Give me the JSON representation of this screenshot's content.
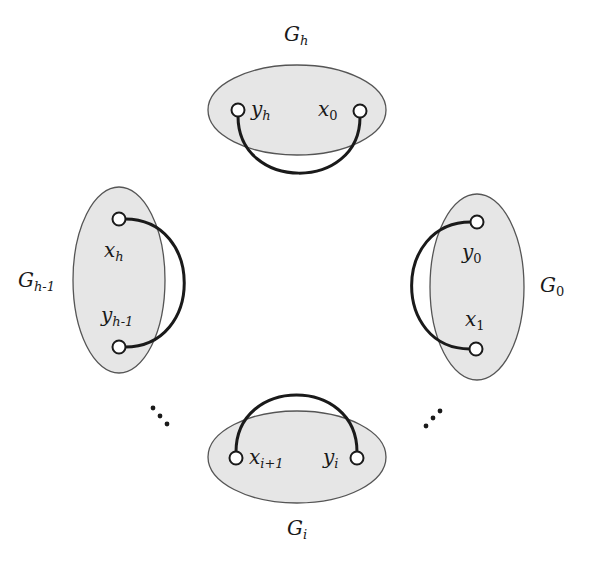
{
  "diagram": {
    "type": "cyclic-graph-decomposition",
    "colors": {
      "ellipse_fill": "#e6e6e6",
      "ellipse_stroke": "#555555",
      "edge": "#1a1a1a",
      "node_fill": "#ffffff",
      "node_stroke": "#1a1a1a"
    },
    "groups": [
      {
        "id": "G_h",
        "label_base": "G",
        "label_sub": "h",
        "nodes": [
          {
            "base": "y",
            "sub": "h"
          },
          {
            "base": "x",
            "sub": "0"
          }
        ]
      },
      {
        "id": "G_0",
        "label_base": "G",
        "label_sub": "0",
        "nodes": [
          {
            "base": "y",
            "sub": "0"
          },
          {
            "base": "x",
            "sub": "1"
          }
        ]
      },
      {
        "id": "G_i",
        "label_base": "G",
        "label_sub": "i",
        "nodes": [
          {
            "base": "x",
            "sub": "i+1"
          },
          {
            "base": "y",
            "sub": "i"
          }
        ]
      },
      {
        "id": "G_h-1",
        "label_base": "G",
        "label_sub": "h-1",
        "nodes": [
          {
            "base": "x",
            "sub": "h"
          },
          {
            "base": "y",
            "sub": "h-1"
          }
        ]
      }
    ],
    "edges": [
      {
        "from": "y_h",
        "to": "x_0"
      },
      {
        "from": "y_0",
        "to": "x_1"
      },
      {
        "from": "x_i+1",
        "to": "y_i"
      },
      {
        "from": "x_h",
        "to": "y_h-1"
      }
    ],
    "ellipsis": [
      "lower-left-dots",
      "lower-right-dots"
    ]
  }
}
